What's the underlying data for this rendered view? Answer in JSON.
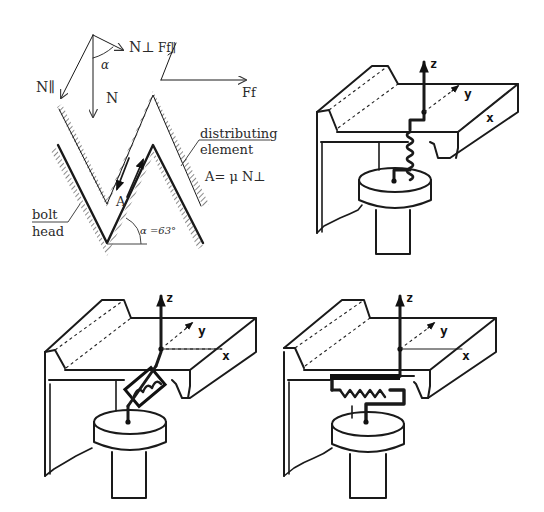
{
  "figure": {
    "panels": [
      {
        "id": "thread-force-diagram",
        "position": "top-left",
        "labels": {
          "n_perp": "N⊥",
          "f_f_parallel": "Ff∥",
          "alpha": "α",
          "n_parallel": "N∥",
          "n": "N",
          "f_f": "Ff",
          "distributing": "distributing",
          "element": "element",
          "friction_formula": "A= μ N⊥",
          "a_point": "A",
          "bolt": "bolt",
          "head": "head",
          "angle": "α =63°"
        }
      },
      {
        "id": "model-vertical-spring",
        "position": "top-right",
        "axes": {
          "z": "z",
          "y": "y",
          "x": "x"
        }
      },
      {
        "id": "model-inclined-spring",
        "position": "bottom-left",
        "axes": {
          "z": "z",
          "y": "y",
          "x": "x"
        }
      },
      {
        "id": "model-horizontal-spring",
        "position": "bottom-right",
        "axes": {
          "z": "z",
          "y": "y",
          "x": "x"
        }
      }
    ],
    "colors": {
      "ink": "#1a1a1a",
      "text": "#2a2a2a",
      "background": "#ffffff"
    }
  }
}
